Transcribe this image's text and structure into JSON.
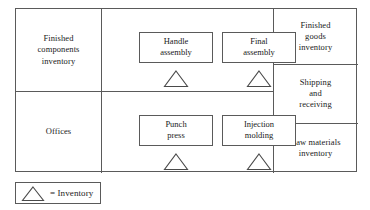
{
  "diagram": {
    "areas": [
      {
        "id": "finished-components-inventory",
        "label": "Finished\ncomponents\ninventory"
      },
      {
        "id": "offices",
        "label": "Offices"
      },
      {
        "id": "finished-goods-inventory",
        "label": "Finished\ngoods\ninventory"
      },
      {
        "id": "shipping-and-receiving",
        "label": "Shipping\nand\nreceiving"
      },
      {
        "id": "raw-materials-inventory",
        "label": "Raw materials\ninventory"
      }
    ],
    "workcenters": [
      {
        "id": "handle-assembly",
        "label": "Handle\nassembly",
        "has_inventory": true
      },
      {
        "id": "final-assembly",
        "label": "Final\nassembly",
        "has_inventory": true
      },
      {
        "id": "punch-press",
        "label": "Punch\npress",
        "has_inventory": true
      },
      {
        "id": "injection-molding",
        "label": "Injection\nmolding",
        "has_inventory": true
      }
    ],
    "legend": {
      "symbol": "inventory-triangle-icon",
      "text": "= Inventory"
    },
    "colors": {
      "line": "#5a5a5a",
      "symbol_stroke": "#4a4a4a",
      "text": "#1a1a1a",
      "background": "#ffffff"
    }
  }
}
